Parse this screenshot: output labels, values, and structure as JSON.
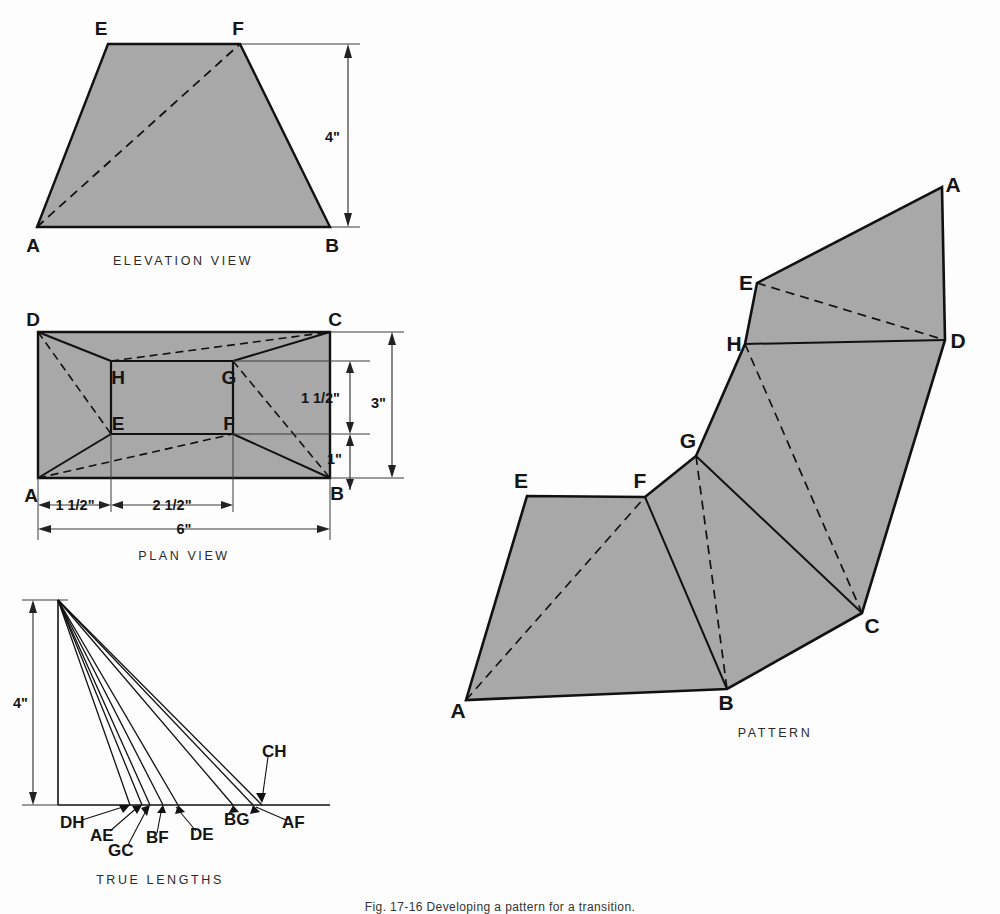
{
  "figure": {
    "bottom_caption": "Fig. 17-16 Developing a pattern for a transition."
  },
  "colors": {
    "fill_gray": "#a8a8a8",
    "line_black": "#111111",
    "thin_line": "#3a3a3a",
    "background": "#fdfdfd"
  },
  "views": {
    "elevation": {
      "caption": "ELEVATION VIEW",
      "vertices": [
        {
          "label": "E",
          "x": 108,
          "y": 44
        },
        {
          "label": "F",
          "x": 240,
          "y": 44
        },
        {
          "label": "B",
          "x": 330,
          "y": 227
        },
        {
          "label": "A",
          "x": 37,
          "y": 227
        }
      ],
      "hidden_lines": [
        "A-F"
      ],
      "dimension": {
        "label": "4\"",
        "value": 4,
        "unit": "in",
        "orientation": "vertical"
      }
    },
    "plan": {
      "caption": "PLAN VIEW",
      "outer_vertices": [
        {
          "label": "D",
          "x": 38,
          "y": 332
        },
        {
          "label": "C",
          "x": 330,
          "y": 332
        },
        {
          "label": "B",
          "x": 330,
          "y": 478
        },
        {
          "label": "A",
          "x": 38,
          "y": 478
        }
      ],
      "inner_vertices": [
        {
          "label": "H",
          "x": 111,
          "y": 361
        },
        {
          "label": "G",
          "x": 233,
          "y": 361
        },
        {
          "label": "F",
          "x": 233,
          "y": 434
        },
        {
          "label": "E",
          "x": 111,
          "y": 434
        }
      ],
      "hidden_lines": [
        "D-G",
        "H-C",
        "A-F",
        "E-B",
        "A-G",
        "C-E"
      ],
      "dimensions": [
        {
          "label": "1 1/2\"",
          "value": 1.5,
          "unit": "in",
          "orientation": "horizontal",
          "span": "A to E"
        },
        {
          "label": "2 1/2\"",
          "value": 2.5,
          "unit": "in",
          "orientation": "horizontal",
          "span": "E to F"
        },
        {
          "label": "6\"",
          "value": 6,
          "unit": "in",
          "orientation": "horizontal",
          "span": "A to B"
        },
        {
          "label": "1 1/2\"",
          "value": 1.5,
          "unit": "in",
          "orientation": "vertical",
          "span": "G line to F line"
        },
        {
          "label": "1\"",
          "value": 1,
          "unit": "in",
          "orientation": "vertical",
          "span": "F line to B"
        },
        {
          "label": "3\"",
          "value": 3,
          "unit": "in",
          "orientation": "vertical",
          "span": "C to B"
        }
      ]
    },
    "true_lengths": {
      "caption": "TRUE LENGTHS",
      "height_dimension": {
        "label": "4\"",
        "value": 4,
        "unit": "in"
      },
      "apex": {
        "x": 58,
        "y": 600
      },
      "baseline_y": 805,
      "baseline_x_start": 58,
      "baseline_x_end": 330,
      "rays": [
        {
          "label": "DH",
          "x_end": 130
        },
        {
          "label": "AE",
          "x_end": 142
        },
        {
          "label": "GC",
          "x_end": 150
        },
        {
          "label": "BF",
          "x_end": 163
        },
        {
          "label": "DE",
          "x_end": 178
        },
        {
          "label": "BG",
          "x_end": 233
        },
        {
          "label": "AF",
          "x_end": 253
        },
        {
          "label": "CH",
          "x_end": 262
        }
      ],
      "ray_labels": [
        {
          "text": "DH",
          "x": 60,
          "y": 827
        },
        {
          "text": "AE",
          "x": 92,
          "y": 838
        },
        {
          "text": "GC",
          "x": 112,
          "y": 852
        },
        {
          "text": "BF",
          "x": 148,
          "y": 840
        },
        {
          "text": "DE",
          "x": 190,
          "y": 838
        },
        {
          "text": "BG",
          "x": 228,
          "y": 824
        },
        {
          "text": "AF",
          "x": 281,
          "y": 827
        },
        {
          "text": "CH",
          "x": 262,
          "y": 752
        }
      ]
    },
    "pattern": {
      "caption": "PATTERN",
      "vertices": [
        {
          "label": "A",
          "x": 466,
          "y": 700
        },
        {
          "label": "E",
          "x": 527,
          "y": 496
        },
        {
          "label": "F",
          "x": 645,
          "y": 497
        },
        {
          "label": "G",
          "x": 696,
          "y": 456
        },
        {
          "label": "H",
          "x": 745,
          "y": 344
        },
        {
          "label": "E",
          "x": 757,
          "y": 283
        },
        {
          "label": "A",
          "x": 942,
          "y": 187
        },
        {
          "label": "D",
          "x": 945,
          "y": 340
        },
        {
          "label": "C",
          "x": 862,
          "y": 613
        },
        {
          "label": "B",
          "x": 727,
          "y": 689
        }
      ],
      "hidden_lines": [
        "A-F",
        "G-B",
        "H-C",
        "E-D",
        "D-H"
      ]
    }
  }
}
